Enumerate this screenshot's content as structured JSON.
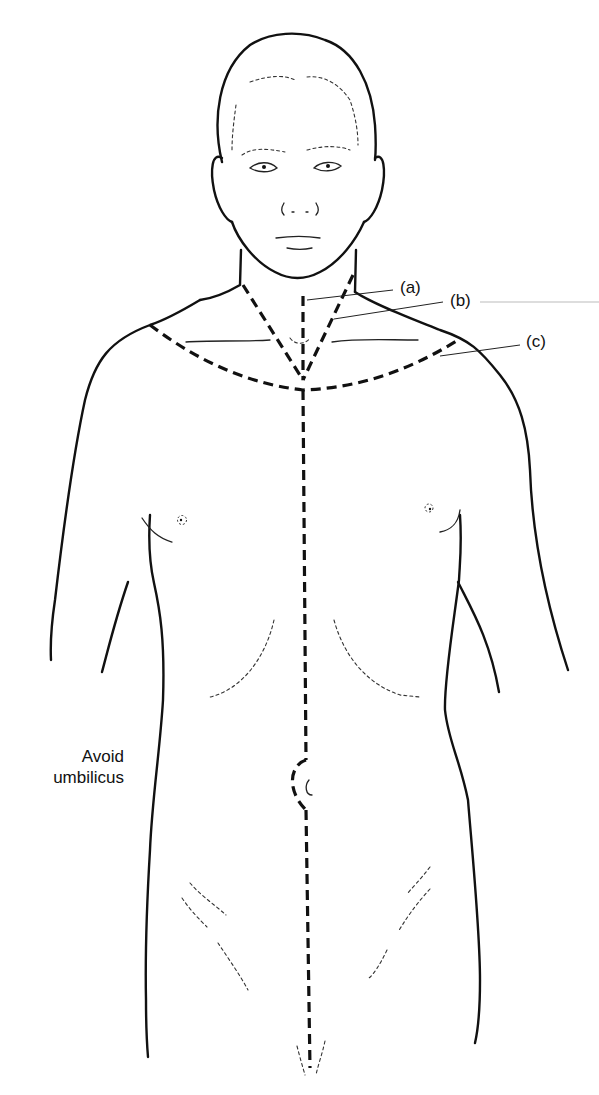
{
  "figure": {
    "labels": [
      {
        "id": "a",
        "text": "(a)"
      },
      {
        "id": "b",
        "text": "(b)"
      },
      {
        "id": "c",
        "text": "(c)"
      }
    ],
    "annotation": {
      "line1": "Avoid",
      "line2": "umbilicus"
    },
    "colors": {
      "line": "#111111",
      "background": "#ffffff"
    }
  }
}
